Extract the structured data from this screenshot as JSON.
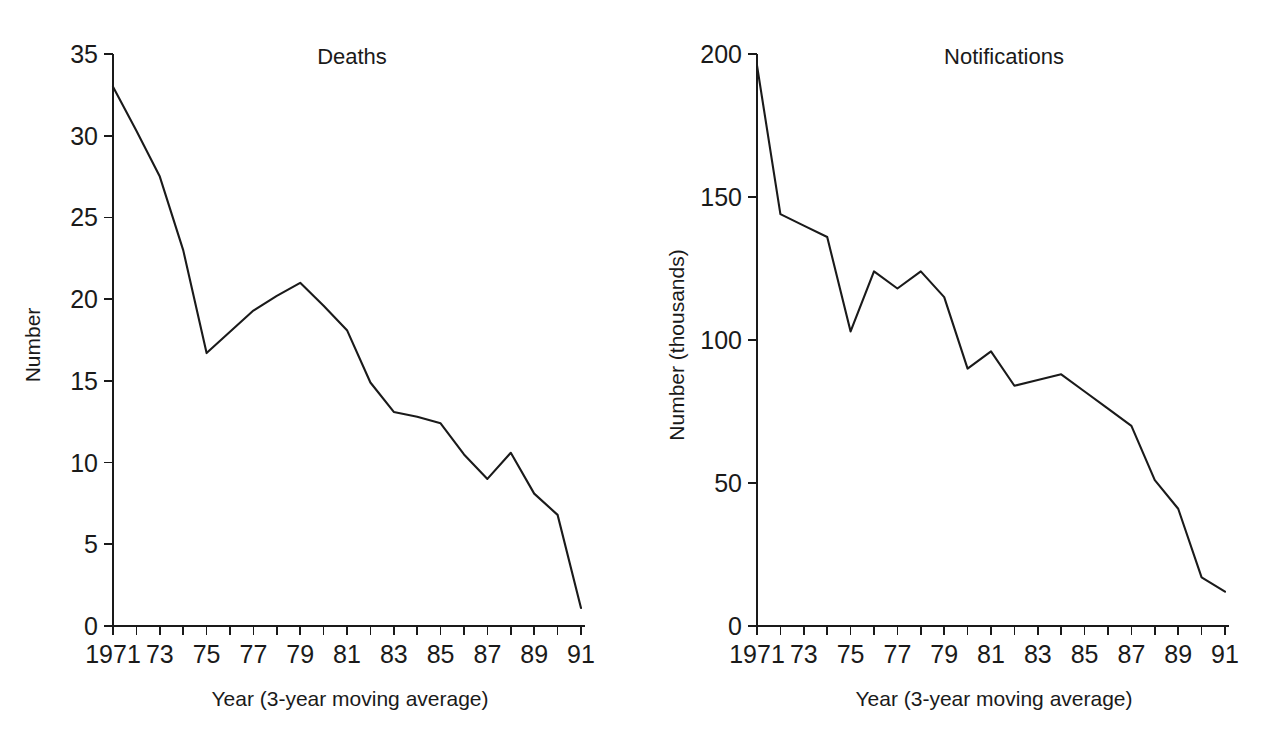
{
  "figure": {
    "background": "#ffffff",
    "line_color": "#1a1a1a",
    "axis_color": "#1a1a1a"
  },
  "panels": [
    {
      "id": "deaths",
      "title": "Deaths",
      "ylabel": "Number",
      "xlabel": "Year (3-year moving average)",
      "y_ticks": [
        "0",
        "5",
        "10",
        "15",
        "20",
        "25",
        "30",
        "35"
      ],
      "x_ticks": [
        "1971",
        "73",
        "75",
        "77",
        "79",
        "81",
        "83",
        "85",
        "87",
        "89",
        "91"
      ]
    },
    {
      "id": "notifications",
      "title": "Notifications",
      "ylabel": "Number (thousands)",
      "xlabel": "Year (3-year moving average)",
      "y_ticks": [
        "0",
        "50",
        "100",
        "150",
        "200"
      ],
      "x_ticks": [
        "1971",
        "73",
        "75",
        "77",
        "79",
        "81",
        "83",
        "85",
        "87",
        "89",
        "91"
      ]
    }
  ],
  "chart_data": [
    {
      "type": "line",
      "title": "Deaths",
      "xlabel": "Year (3-year moving average)",
      "ylabel": "Number",
      "xlim": [
        1971,
        1991
      ],
      "ylim": [
        0,
        35
      ],
      "y_tick_values": [
        0,
        5,
        10,
        15,
        20,
        25,
        30,
        35
      ],
      "x_tick_values": [
        1971,
        1972,
        1973,
        1974,
        1975,
        1976,
        1977,
        1978,
        1979,
        1980,
        1981,
        1982,
        1983,
        1984,
        1985,
        1986,
        1987,
        1988,
        1989,
        1990,
        1991
      ],
      "x_tick_labels": [
        "1971",
        "",
        "73",
        "",
        "75",
        "",
        "77",
        "",
        "79",
        "",
        "81",
        "",
        "83",
        "",
        "85",
        "",
        "87",
        "",
        "89",
        "",
        "91"
      ],
      "grid": false,
      "legend": "none",
      "x": [
        1971,
        1972,
        1973,
        1974,
        1975,
        1976,
        1977,
        1978,
        1979,
        1980,
        1981,
        1982,
        1983,
        1984,
        1985,
        1986,
        1987,
        1988,
        1989,
        1990,
        1991
      ],
      "values": [
        33.0,
        30.3,
        27.5,
        23.0,
        16.7,
        18.0,
        19.3,
        20.2,
        21.0,
        19.6,
        18.1,
        14.9,
        13.1,
        12.8,
        12.4,
        10.5,
        9.0,
        10.6,
        8.1,
        6.8,
        1.4,
        1.1
      ],
      "series": [
        {
          "name": "Deaths",
          "x": [
            1971,
            1972,
            1973,
            1974,
            1975,
            1976,
            1977,
            1978,
            1979,
            1980,
            1981,
            1982,
            1983,
            1984,
            1985,
            1986,
            1987,
            1988,
            1989,
            1990,
            1991
          ],
          "values": [
            33.0,
            30.3,
            27.5,
            23.0,
            16.7,
            18.0,
            19.3,
            20.2,
            21.0,
            19.6,
            18.1,
            14.9,
            13.1,
            12.8,
            12.4,
            10.5,
            9.0,
            10.6,
            8.1,
            6.8,
            1.1
          ]
        }
      ]
    },
    {
      "type": "line",
      "title": "Notifications",
      "xlabel": "Year (3-year moving average)",
      "ylabel": "Number (thousands)",
      "xlim": [
        1971,
        1991
      ],
      "ylim": [
        0,
        200
      ],
      "y_tick_values": [
        0,
        50,
        100,
        150,
        200
      ],
      "x_tick_values": [
        1971,
        1972,
        1973,
        1974,
        1975,
        1976,
        1977,
        1978,
        1979,
        1980,
        1981,
        1982,
        1983,
        1984,
        1985,
        1986,
        1987,
        1988,
        1989,
        1990,
        1991
      ],
      "x_tick_labels": [
        "1971",
        "",
        "73",
        "",
        "75",
        "",
        "77",
        "",
        "79",
        "",
        "81",
        "",
        "83",
        "",
        "85",
        "",
        "87",
        "",
        "89",
        "",
        "91"
      ],
      "grid": false,
      "legend": "none",
      "x": [
        1971,
        1972,
        1973,
        1974,
        1975,
        1976,
        1977,
        1978,
        1979,
        1980,
        1981,
        1982,
        1983,
        1984,
        1985,
        1986,
        1987,
        1988,
        1989,
        1990,
        1991
      ],
      "values": [
        196,
        144,
        140,
        136,
        103,
        124,
        118,
        124,
        115,
        90,
        96,
        84,
        86,
        88,
        82,
        76,
        70,
        51,
        41,
        17,
        12
      ],
      "series": [
        {
          "name": "Notifications",
          "x": [
            1971,
            1972,
            1973,
            1974,
            1975,
            1976,
            1977,
            1978,
            1979,
            1980,
            1981,
            1982,
            1983,
            1984,
            1985,
            1986,
            1987,
            1988,
            1989,
            1990,
            1991
          ],
          "values": [
            196,
            144,
            140,
            136,
            103,
            124,
            118,
            124,
            115,
            90,
            96,
            84,
            86,
            88,
            82,
            76,
            70,
            51,
            41,
            17,
            12
          ]
        }
      ]
    }
  ]
}
